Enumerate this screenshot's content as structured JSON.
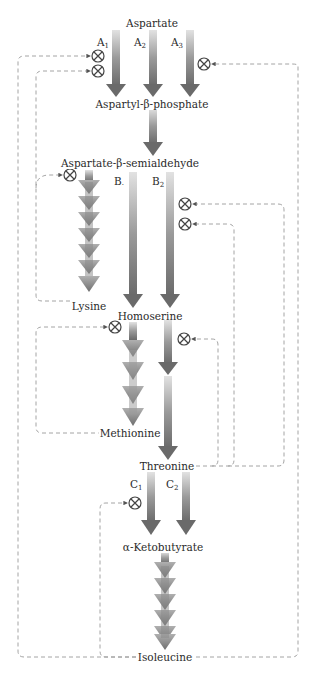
{
  "metabolites": {
    "aspartate": "Aspartate",
    "aspartyl_phosphate": "Aspartyl-β-phosphate",
    "aspartate_semialdehyde": "Aspartate-β-semialdehyde",
    "lysine": "Lysine",
    "homoserine": "Homoserine",
    "methionine": "Methionine",
    "threonine": "Threonine",
    "ketobutyrate": "α-Ketobutyrate",
    "isoleucine": "Isoleucine"
  },
  "enzymes": {
    "a1": {
      "base": "A",
      "sub": "1"
    },
    "a2": {
      "base": "A",
      "sub": "2"
    },
    "a3": {
      "base": "A",
      "sub": "3"
    },
    "b1": {
      "base": "B",
      "sub": "·"
    },
    "b2": {
      "base": "B",
      "sub": "2"
    },
    "c1": {
      "base": "C",
      "sub": "1"
    },
    "c2": {
      "base": "C",
      "sub": "2"
    }
  },
  "inhibition_symbol": "⊗",
  "colors": {
    "arrow_dark": "#6a6a6a",
    "arrow_light": "#d8d8d8",
    "dashed_line": "#9a9a9a",
    "text": "#2a2a2a"
  }
}
